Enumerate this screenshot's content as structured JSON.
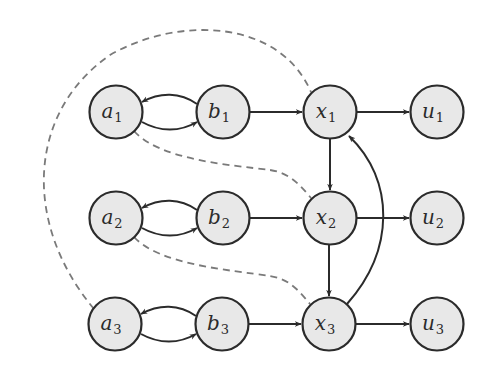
{
  "diagram": {
    "type": "directed-graph",
    "colors": {
      "node_fill": "#e8e8e8",
      "node_stroke": "#2b2b2b",
      "edge": "#2b2b2b",
      "dashed_edge": "#7a7a7a"
    },
    "nodes": [
      {
        "id": "a1",
        "base": "a",
        "sub": "1",
        "x": 116,
        "y": 112
      },
      {
        "id": "b1",
        "base": "b",
        "sub": "1",
        "x": 223,
        "y": 112
      },
      {
        "id": "x1",
        "base": "x",
        "sub": "1",
        "x": 330,
        "y": 112
      },
      {
        "id": "u1",
        "base": "u",
        "sub": "1",
        "x": 437,
        "y": 112
      },
      {
        "id": "a2",
        "base": "a",
        "sub": "2",
        "x": 116,
        "y": 218
      },
      {
        "id": "b2",
        "base": "b",
        "sub": "2",
        "x": 223,
        "y": 218
      },
      {
        "id": "x2",
        "base": "x",
        "sub": "2",
        "x": 330,
        "y": 218
      },
      {
        "id": "u2",
        "base": "u",
        "sub": "2",
        "x": 437,
        "y": 218
      },
      {
        "id": "a3",
        "base": "a",
        "sub": "3",
        "x": 115,
        "y": 324
      },
      {
        "id": "b3",
        "base": "b",
        "sub": "3",
        "x": 222,
        "y": 324
      },
      {
        "id": "x3",
        "base": "x",
        "sub": "3",
        "x": 329,
        "y": 324
      },
      {
        "id": "u3",
        "base": "u",
        "sub": "3",
        "x": 437,
        "y": 324
      }
    ],
    "edges": [
      {
        "from": "b1",
        "to": "a1",
        "style": "solid",
        "curve": "arc-up"
      },
      {
        "from": "a1",
        "to": "b1",
        "style": "solid",
        "curve": "arc-down"
      },
      {
        "from": "b1",
        "to": "x1",
        "style": "solid"
      },
      {
        "from": "x1",
        "to": "u1",
        "style": "solid"
      },
      {
        "from": "b2",
        "to": "a2",
        "style": "solid",
        "curve": "arc-up"
      },
      {
        "from": "a2",
        "to": "b2",
        "style": "solid",
        "curve": "arc-down"
      },
      {
        "from": "b2",
        "to": "x2",
        "style": "solid"
      },
      {
        "from": "x2",
        "to": "u2",
        "style": "solid"
      },
      {
        "from": "b3",
        "to": "a3",
        "style": "solid",
        "curve": "arc-up"
      },
      {
        "from": "a3",
        "to": "b3",
        "style": "solid",
        "curve": "arc-down"
      },
      {
        "from": "b3",
        "to": "x3",
        "style": "solid"
      },
      {
        "from": "x3",
        "to": "u3",
        "style": "solid"
      },
      {
        "from": "x1",
        "to": "x2",
        "style": "solid"
      },
      {
        "from": "x2",
        "to": "x3",
        "style": "solid"
      },
      {
        "from": "x3",
        "to": "x1",
        "style": "solid",
        "curve": "bend-right"
      },
      {
        "from": "a3",
        "to": "x1",
        "style": "dashed",
        "curve": "big-loop-left"
      },
      {
        "from": "a1",
        "to": "x2",
        "style": "dashed"
      },
      {
        "from": "a2",
        "to": "x3",
        "style": "dashed"
      }
    ]
  },
  "background_text": [
    "",
    "",
    "",
    "",
    ""
  ]
}
